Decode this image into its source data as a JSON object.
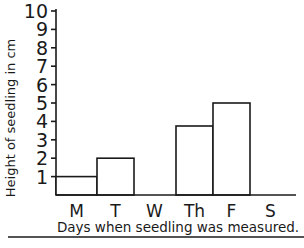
{
  "chart_data": {
    "type": "bar",
    "title": "",
    "xlabel": "Days when seedling was measured.",
    "ylabel": "Height of seedling in cm",
    "categories": [
      "M",
      "T",
      "W",
      "Th",
      "F",
      "S"
    ],
    "values": [
      1,
      2,
      0,
      3.75,
      5,
      0
    ],
    "ylim": [
      0,
      10
    ],
    "yticks": [
      1,
      2,
      3,
      4,
      5,
      6,
      7,
      8,
      9,
      10
    ],
    "grid": false,
    "legend": null,
    "bar_fill": "#ffffff",
    "bar_stroke": "#1a1a1a"
  },
  "layout": {
    "axis_x": 56,
    "baseline_y": 195,
    "unit_px": 18.4,
    "bar_width": 38,
    "baseline_end_x": 296,
    "bottom_rule_y": 236
  }
}
